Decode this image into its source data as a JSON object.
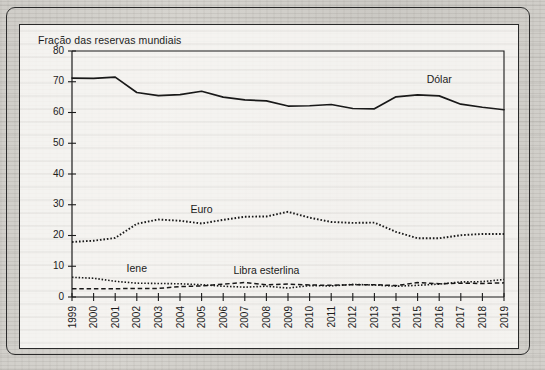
{
  "figure": {
    "axis_title": "Fração das reservas mundiais"
  },
  "chart_data": {
    "type": "line",
    "title": "Fração das reservas mundiais",
    "xlabel": "",
    "ylabel": "Fração das reservas mundiais",
    "ylim": [
      0,
      80
    ],
    "ytick_step": 10,
    "yticks": [
      "0",
      "10",
      "20",
      "30",
      "40",
      "50",
      "60",
      "70",
      "80"
    ],
    "grid": false,
    "legend_position": "inline-labels",
    "x": [
      "1999",
      "2000",
      "2001",
      "2002",
      "2003",
      "2004",
      "2005",
      "2006",
      "2007",
      "2008",
      "2009",
      "2010",
      "2011",
      "2012",
      "2013",
      "2014",
      "2015",
      "2016",
      "2017",
      "2018",
      "2019"
    ],
    "categories": [
      "1999",
      "2000",
      "2001",
      "2002",
      "2003",
      "2004",
      "2005",
      "2006",
      "2007",
      "2008",
      "2009",
      "2010",
      "2011",
      "2012",
      "2013",
      "2014",
      "2015",
      "2016",
      "2017",
      "2018",
      "2019"
    ],
    "series": [
      {
        "name": "Dólar",
        "style": "solid",
        "label_x": "2016",
        "values": [
          71.2,
          71.1,
          71.5,
          66.5,
          65.5,
          65.8,
          66.9,
          65.0,
          64.1,
          63.8,
          62.1,
          62.2,
          62.6,
          61.3,
          61.2,
          65.1,
          65.7,
          65.4,
          62.7,
          61.7,
          60.9
        ]
      },
      {
        "name": "Euro",
        "style": "dotted",
        "label_x": "2005",
        "values": [
          17.9,
          18.3,
          19.2,
          23.8,
          25.2,
          24.8,
          23.9,
          25.1,
          26.1,
          26.2,
          27.7,
          25.8,
          24.4,
          24.1,
          24.2,
          21.2,
          19.1,
          19.1,
          20.1,
          20.5,
          20.5
        ]
      },
      {
        "name": "Iene",
        "style": "dotted",
        "label_x": "2002",
        "values": [
          6.4,
          6.1,
          5.1,
          4.5,
          4.4,
          4.3,
          4.0,
          3.5,
          3.2,
          3.5,
          2.9,
          3.7,
          3.6,
          4.1,
          3.9,
          3.5,
          3.8,
          4.2,
          4.9,
          5.0,
          5.7
        ]
      },
      {
        "name": "Libra esterlina",
        "style": "dashed",
        "label_x": "2008",
        "values": [
          2.7,
          2.7,
          2.7,
          2.8,
          2.8,
          3.4,
          3.6,
          4.2,
          4.7,
          4.0,
          4.2,
          3.9,
          3.8,
          4.0,
          4.0,
          3.7,
          4.7,
          4.3,
          4.5,
          4.4,
          4.6
        ]
      }
    ]
  }
}
